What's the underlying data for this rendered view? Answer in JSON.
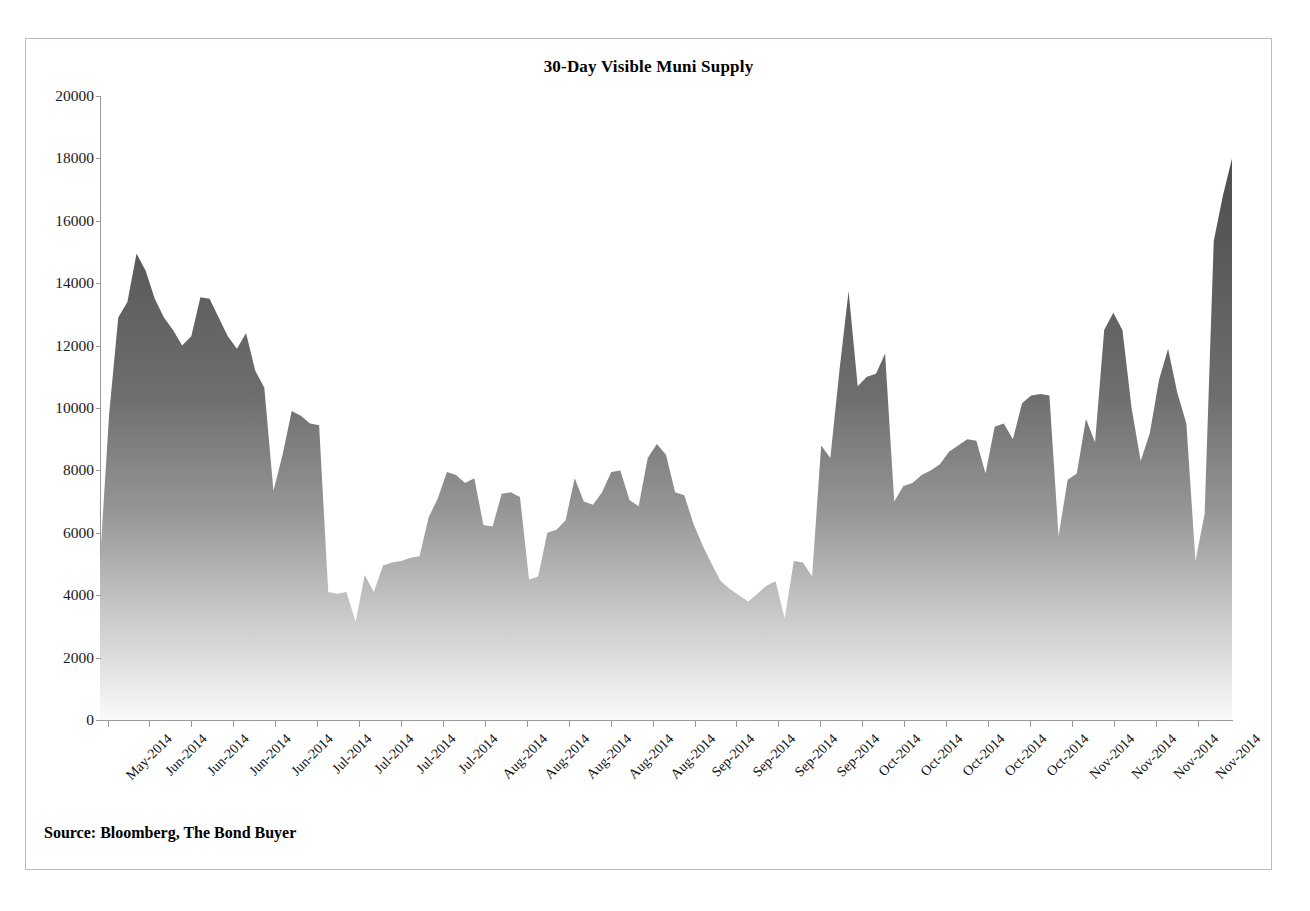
{
  "figure": {
    "title": "30-Day Visible Muni Supply",
    "source_note": "Source: Bloomberg, The Bond Buyer",
    "border_color": "#b9bcc0",
    "background": "#ffffff"
  },
  "chart_data": {
    "type": "area",
    "title": "30-Day Visible Muni Supply",
    "xlabel": "",
    "ylabel": "",
    "ylim": [
      0,
      20000
    ],
    "xlim_labels": [
      "May-2014",
      "Nov-2014"
    ],
    "grid": false,
    "legend": null,
    "y_ticks": [
      0,
      2000,
      4000,
      6000,
      8000,
      10000,
      12000,
      14000,
      16000,
      18000,
      20000
    ],
    "y_tick_labels": [
      "0",
      "2000",
      "4000",
      "6000",
      "8000",
      "10000",
      "12000",
      "14000",
      "16000",
      "18000",
      "20000"
    ],
    "x_tick_labels": [
      "May-2014",
      "Jun-2014",
      "Jun-2014",
      "Jun-2014",
      "Jun-2014",
      "Jul-2014",
      "Jul-2014",
      "Jul-2014",
      "Jul-2014",
      "Aug-2014",
      "Aug-2014",
      "Aug-2014",
      "Aug-2014",
      "Aug-2014",
      "Sep-2014",
      "Sep-2014",
      "Sep-2014",
      "Sep-2014",
      "Oct-2014",
      "Oct-2014",
      "Oct-2014",
      "Oct-2014",
      "Oct-2014",
      "Nov-2014",
      "Nov-2014",
      "Nov-2014",
      "Nov-2014"
    ],
    "series_name": "30-Day Visible Muni Supply",
    "fill": {
      "gradient": "vertical",
      "top_color": "#5c5c5c",
      "bottom_color": "#fbfbfb"
    },
    "units": "$ millions",
    "values": [
      5100,
      9800,
      12900,
      13400,
      14950,
      14400,
      13500,
      12900,
      12500,
      12000,
      12300,
      13550,
      13500,
      12900,
      12300,
      11900,
      12400,
      11200,
      10650,
      7350,
      8500,
      9900,
      9750,
      9500,
      9450,
      4100,
      4050,
      4100,
      3150,
      4650,
      4100,
      4950,
      5050,
      5100,
      5200,
      5250,
      6500,
      7100,
      7950,
      7850,
      7600,
      7750,
      6250,
      6200,
      7250,
      7300,
      7150,
      4500,
      4600,
      6000,
      6100,
      6400,
      7750,
      7000,
      6900,
      7300,
      7950,
      8000,
      7050,
      6850,
      8400,
      8850,
      8500,
      7300,
      7200,
      6300,
      5600,
      5000,
      4450,
      4200,
      4000,
      3800,
      4050,
      4300,
      4450,
      3250,
      5100,
      5050,
      4600,
      8800,
      8400,
      11200,
      13750,
      10700,
      11000,
      11100,
      11750,
      7000,
      7500,
      7600,
      7850,
      8000,
      8200,
      8600,
      8800,
      9000,
      8950,
      7900,
      9400,
      9500,
      9000,
      10150,
      10400,
      10450,
      10400,
      5900,
      7700,
      7900,
      9650,
      8900,
      12500,
      13050,
      12500,
      10000,
      8300,
      9200,
      10900,
      11900,
      10500,
      9500,
      5100,
      6600,
      15350,
      16800,
      18000
    ]
  }
}
